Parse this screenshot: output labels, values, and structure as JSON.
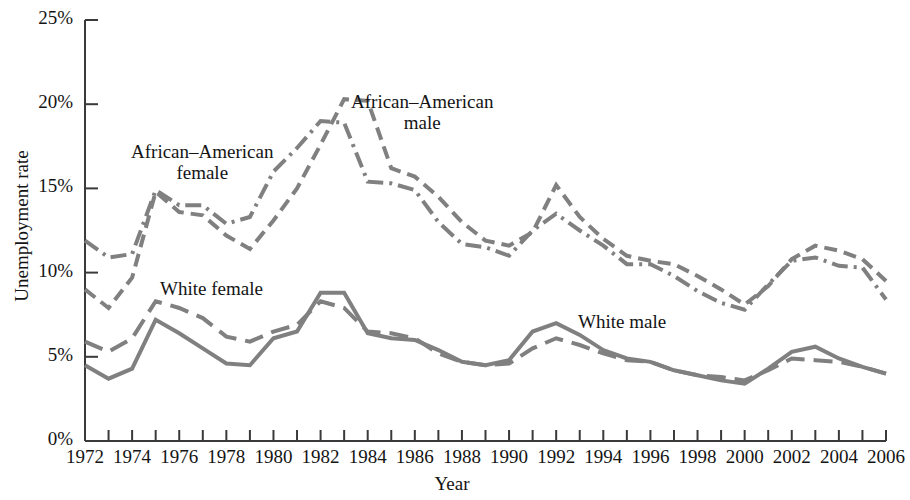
{
  "chart_data": {
    "type": "line",
    "title": "",
    "xlabel": "Year",
    "ylabel": "Unemployment rate",
    "xlim": [
      1972,
      2006
    ],
    "ylim": [
      0,
      25
    ],
    "grid": false,
    "legend_position": "inline-annotations",
    "y_tick_labels": [
      "0%",
      "5%",
      "10%",
      "15%",
      "20%",
      "25%"
    ],
    "y_ticks": [
      0,
      5,
      10,
      15,
      20,
      25
    ],
    "x_tick_labels": [
      "1972",
      "1974",
      "1976",
      "1978",
      "1980",
      "1982",
      "1984",
      "1986",
      "1988",
      "1990",
      "1992",
      "1994",
      "1996",
      "1998",
      "2000",
      "2002",
      "2004",
      "2006"
    ],
    "x_ticks": [
      1972,
      1974,
      1976,
      1978,
      1980,
      1982,
      1984,
      1986,
      1988,
      1990,
      1992,
      1994,
      1996,
      1998,
      2000,
      2002,
      2004,
      2006
    ],
    "x_minor_ticks_every": 1,
    "x": [
      1972,
      1973,
      1974,
      1975,
      1976,
      1977,
      1978,
      1979,
      1980,
      1981,
      1982,
      1983,
      1984,
      1985,
      1986,
      1987,
      1988,
      1989,
      1990,
      1991,
      1992,
      1993,
      1994,
      1995,
      1996,
      1997,
      1998,
      1999,
      2000,
      2001,
      2002,
      2003,
      2004,
      2005,
      2006
    ],
    "line_color": "#808080",
    "series": [
      {
        "name": "African-American male",
        "label": "African–American\nmale",
        "style": "dash-dot",
        "color": "#808080",
        "values": [
          11.9,
          10.9,
          11.1,
          14.9,
          14.0,
          14.0,
          12.9,
          13.3,
          16.0,
          17.4,
          19.0,
          18.9,
          15.4,
          15.3,
          14.9,
          13.0,
          11.7,
          11.5,
          11.0,
          12.5,
          13.5,
          12.5,
          11.6,
          10.5,
          10.5,
          9.8,
          8.9,
          8.2,
          7.8,
          9.3,
          10.7,
          10.9,
          10.4,
          10.3,
          8.4
        ]
      },
      {
        "name": "African-American female",
        "label": "African–American\nfemale",
        "style": "dashed",
        "color": "#808080",
        "values": [
          9.0,
          7.9,
          9.7,
          14.8,
          13.6,
          13.4,
          12.2,
          11.4,
          13.1,
          15.0,
          17.6,
          20.3,
          20.2,
          16.2,
          15.7,
          14.5,
          13.0,
          11.9,
          11.6,
          12.4,
          15.2,
          13.3,
          12.0,
          11.0,
          10.7,
          10.5,
          9.8,
          9.0,
          8.1,
          9.2,
          10.8,
          11.6,
          11.3,
          10.8,
          9.5
        ]
      },
      {
        "name": "White female",
        "label": "White female",
        "style": "dashed-long",
        "color": "#808080",
        "values": [
          5.9,
          5.3,
          6.1,
          8.3,
          7.9,
          7.3,
          6.2,
          5.9,
          6.5,
          6.9,
          8.3,
          7.9,
          6.5,
          6.4,
          6.1,
          5.2,
          4.7,
          4.5,
          4.6,
          5.5,
          6.1,
          5.7,
          5.2,
          4.8,
          4.7,
          4.2,
          3.9,
          3.8,
          3.6,
          4.2,
          4.9,
          4.8,
          4.7,
          4.4,
          4.0
        ]
      },
      {
        "name": "White male",
        "label": "White male",
        "style": "solid",
        "color": "#808080",
        "values": [
          4.5,
          3.7,
          4.3,
          7.2,
          6.4,
          5.5,
          4.6,
          4.5,
          6.1,
          6.5,
          8.8,
          8.8,
          6.4,
          6.1,
          6.0,
          5.4,
          4.7,
          4.5,
          4.8,
          6.5,
          7.0,
          6.3,
          5.4,
          4.9,
          4.7,
          4.2,
          3.9,
          3.6,
          3.4,
          4.3,
          5.3,
          5.6,
          4.9,
          4.4,
          4.0
        ]
      }
    ]
  },
  "axes": {
    "y_title": "Unemployment rate",
    "x_title": "Year"
  },
  "annotations": {
    "aa_female_line1": "African–American",
    "aa_female_line2": "female",
    "aa_male_line1": "African–American",
    "aa_male_line2": "male",
    "white_female": "White female",
    "white_male": "White male"
  }
}
